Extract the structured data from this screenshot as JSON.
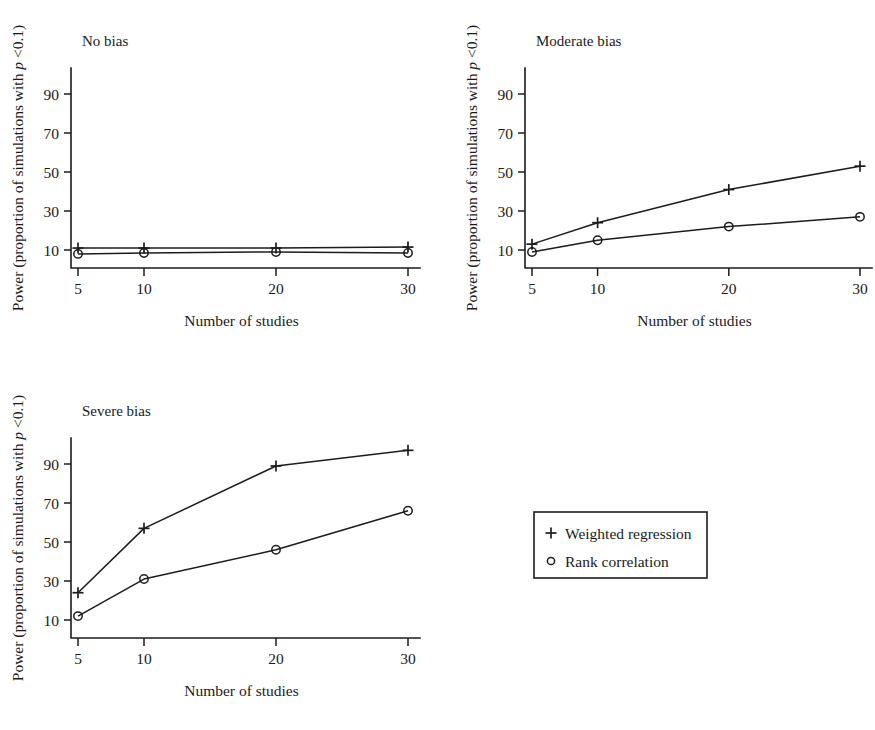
{
  "figure": {
    "background_color": "#ffffff",
    "ink_color": "#1c1c1c",
    "x_axis_label": "Number of studies",
    "y_axis_label_prefix": "Power (proportion of simulations with ",
    "y_axis_label_italic": "p",
    "y_axis_label_suffix": " <0.1)"
  },
  "legend": {
    "entries": [
      {
        "marker": "plus-marker",
        "label": "Weighted regression"
      },
      {
        "marker": "circle-marker",
        "label": "Rank correlation"
      }
    ]
  },
  "chart_data": [
    {
      "type": "line",
      "title": "No bias",
      "xlabel": "Number of studies",
      "ylabel": "Power (proportion of simulations with p <0.1)",
      "x": [
        5,
        10,
        20,
        30
      ],
      "xtick_labels": [
        "5",
        "10",
        "20",
        "30"
      ],
      "ytick_labels": [
        "10",
        "30",
        "50",
        "70",
        "90"
      ],
      "yticks": [
        10,
        30,
        50,
        70,
        90
      ],
      "xlim": [
        5,
        30
      ],
      "ylim": [
        0,
        100
      ],
      "grid": false,
      "legend_position": "external-bottom-right",
      "series": [
        {
          "name": "Weighted regression",
          "marker": "+",
          "values": [
            11,
            11,
            11,
            11.5
          ]
        },
        {
          "name": "Rank correlation",
          "marker": "o",
          "values": [
            8,
            8.5,
            9,
            8.5
          ]
        }
      ]
    },
    {
      "type": "line",
      "title": "Moderate bias",
      "xlabel": "Number of studies",
      "ylabel": "Power (proportion of simulations with p <0.1)",
      "x": [
        5,
        10,
        20,
        30
      ],
      "xtick_labels": [
        "5",
        "10",
        "20",
        "30"
      ],
      "ytick_labels": [
        "10",
        "30",
        "50",
        "70",
        "90"
      ],
      "yticks": [
        10,
        30,
        50,
        70,
        90
      ],
      "xlim": [
        5,
        30
      ],
      "ylim": [
        0,
        100
      ],
      "grid": false,
      "legend_position": "external-bottom-right",
      "series": [
        {
          "name": "Weighted regression",
          "marker": "+",
          "values": [
            13,
            24,
            41,
            53
          ]
        },
        {
          "name": "Rank correlation",
          "marker": "o",
          "values": [
            9,
            15,
            22,
            27
          ]
        }
      ]
    },
    {
      "type": "line",
      "title": "Severe bias",
      "xlabel": "Number of studies",
      "ylabel": "Power (proportion of simulations with p <0.1)",
      "x": [
        5,
        10,
        20,
        30
      ],
      "xtick_labels": [
        "5",
        "10",
        "20",
        "30"
      ],
      "ytick_labels": [
        "10",
        "30",
        "50",
        "70",
        "90"
      ],
      "yticks": [
        10,
        30,
        50,
        70,
        90
      ],
      "xlim": [
        5,
        30
      ],
      "ylim": [
        0,
        100
      ],
      "grid": false,
      "legend_position": "external-bottom-right",
      "series": [
        {
          "name": "Weighted regression",
          "marker": "+",
          "values": [
            24,
            57,
            89,
            97
          ]
        },
        {
          "name": "Rank correlation",
          "marker": "o",
          "values": [
            12,
            31,
            46,
            66
          ]
        }
      ]
    }
  ]
}
